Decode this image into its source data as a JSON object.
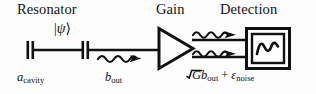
{
  "figure": {
    "type": "schematic-diagram",
    "background_color": "#fdfdfd",
    "ink_color": "#111111"
  },
  "headings": [
    {
      "id": "resonator",
      "label": "Resonator"
    },
    {
      "id": "gain",
      "label": "Gain"
    },
    {
      "id": "detection",
      "label": "Detection"
    }
  ],
  "state_label": {
    "bra_open": "|",
    "symbol": "ψ",
    "ket_close": "⟩",
    "full": "|ψ⟩"
  },
  "mode_labels": [
    {
      "id": "cavity-mode",
      "symbol": "a",
      "subscript": "cavity",
      "full": "a_cavity"
    },
    {
      "id": "output-mode",
      "symbol": "b",
      "subscript": "out",
      "full": "b_out"
    }
  ],
  "amplified_output": {
    "id": "amplified-output",
    "sqrt_radicand": "G",
    "term1_symbol": "b",
    "term1_subscript": "out",
    "operator": "+",
    "term2_symbol": "ε",
    "term2_subscript": "noise",
    "full": "√G b_out + ε_noise"
  },
  "components": [
    {
      "id": "capacitor-input",
      "name": "capacitor",
      "x": 30,
      "y": 50
    },
    {
      "id": "capacitor-output",
      "name": "capacitor",
      "x": 85,
      "y": 50
    },
    {
      "id": "amplifier-triangle",
      "name": "amplifier",
      "x": 158,
      "y": 48
    },
    {
      "id": "detector-box",
      "name": "oscilloscope",
      "x": 267,
      "y": 48,
      "glyph": "sine-wave"
    }
  ],
  "photon_arrows": [
    {
      "id": "photon-arrow-out",
      "from_x": 98,
      "to_x": 145,
      "y": 59
    },
    {
      "id": "photon-arrow-amp-top",
      "from_x": 193,
      "to_x": 241,
      "y": 35
    },
    {
      "id": "photon-arrow-amp-bottom",
      "from_x": 193,
      "to_x": 241,
      "y": 54
    }
  ]
}
